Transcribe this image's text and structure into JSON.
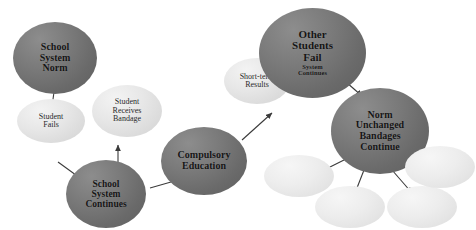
{
  "diagram": {
    "background_color": "#ffffff",
    "colors": {
      "dark_node_fill": "#6a6a6a",
      "light_node_fill": "#e4e4e4",
      "blank_node_fill": "#ededed",
      "arrow_color": "#3a3a3a",
      "dark_node_text": "#151515",
      "light_node_text": "#2a2a2a"
    },
    "nodes": [
      {
        "id": "school-system-norm",
        "lines": [
          "School",
          "System",
          "Norm"
        ],
        "style": "dark",
        "x": 13,
        "y": 22,
        "w": 84,
        "h": 72,
        "font_size": 10
      },
      {
        "id": "student-fails",
        "lines": [
          "Student",
          "Fails"
        ],
        "style": "light",
        "x": 17,
        "y": 99,
        "w": 68,
        "h": 44,
        "font_size": 8
      },
      {
        "id": "student-receives-bandage",
        "lines": [
          "Student",
          "Receives",
          "Bandage"
        ],
        "style": "light",
        "x": 92,
        "y": 85,
        "w": 70,
        "h": 52,
        "font_size": 8
      },
      {
        "id": "school-system-continues",
        "lines": [
          "School",
          "System",
          "Continues"
        ],
        "style": "dark",
        "x": 66,
        "y": 160,
        "w": 80,
        "h": 68,
        "font_size": 9.5
      },
      {
        "id": "compulsory-education",
        "lines": [
          "Compulsory",
          "Education"
        ],
        "style": "dark",
        "x": 161,
        "y": 127,
        "w": 86,
        "h": 68,
        "font_size": 10
      },
      {
        "id": "short-term-results",
        "lines": [
          "Short-term",
          "Results"
        ],
        "style": "light",
        "x": 224,
        "y": 58,
        "w": 66,
        "h": 46,
        "font_size": 8
      },
      {
        "id": "other-students-fail",
        "lines": [
          "Other",
          "Students",
          "Fail"
        ],
        "sub_lines": [
          "System",
          "Continues"
        ],
        "style": "dark",
        "x": 259,
        "y": 8,
        "w": 107,
        "h": 90,
        "font_size": 11
      },
      {
        "id": "norm-unchanged-bandages-continue",
        "lines": [
          "Norm",
          "Unchanged",
          "Bandages",
          "Continue"
        ],
        "style": "dark",
        "x": 331,
        "y": 88,
        "w": 98,
        "h": 86,
        "font_size": 10
      },
      {
        "id": "outcome-left",
        "lines": [],
        "style": "blank",
        "x": 264,
        "y": 155,
        "w": 70,
        "h": 42,
        "font_size": 8
      },
      {
        "id": "outcome-mid-left",
        "lines": [],
        "style": "blank",
        "x": 315,
        "y": 186,
        "w": 70,
        "h": 42,
        "font_size": 8
      },
      {
        "id": "outcome-mid-right",
        "lines": [],
        "style": "blank",
        "x": 387,
        "y": 186,
        "w": 70,
        "h": 42,
        "font_size": 8
      },
      {
        "id": "outcome-right",
        "lines": [],
        "style": "blank",
        "x": 405,
        "y": 146,
        "w": 70,
        "h": 42,
        "font_size": 8
      }
    ],
    "arrows": [
      {
        "id": "norm-to-student-fails",
        "x1": 54,
        "y1": 92,
        "x2": 50,
        "y2": 121
      },
      {
        "id": "fails-to-system-continues",
        "x1": 58,
        "y1": 162,
        "x2": 80,
        "y2": 178
      },
      {
        "id": "continues-to-bandage",
        "x1": 118,
        "y1": 168,
        "x2": 118,
        "y2": 145
      },
      {
        "id": "continues-to-compulsory",
        "x1": 150,
        "y1": 188,
        "x2": 185,
        "y2": 178
      },
      {
        "id": "compulsory-to-short-term",
        "x1": 242,
        "y1": 140,
        "x2": 272,
        "y2": 113
      },
      {
        "id": "other-fail-to-norm-unchanged",
        "x1": 338,
        "y1": 75,
        "x2": 362,
        "y2": 96
      },
      {
        "id": "norm-to-outcome-left",
        "x1": 348,
        "y1": 158,
        "x2": 320,
        "y2": 172
      },
      {
        "id": "norm-to-outcome-mid-left",
        "x1": 364,
        "y1": 170,
        "x2": 355,
        "y2": 193
      },
      {
        "id": "norm-to-outcome-mid-right",
        "x1": 392,
        "y1": 170,
        "x2": 412,
        "y2": 193
      },
      {
        "id": "norm-to-outcome-right",
        "x1": 408,
        "y1": 152,
        "x2": 432,
        "y2": 163
      }
    ]
  }
}
